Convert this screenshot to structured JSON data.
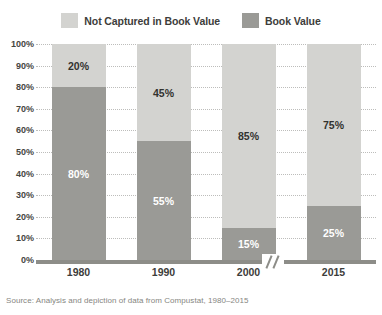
{
  "legend": {
    "items": [
      {
        "label": "Not Captured in Book Value",
        "color": "#d3d3d0",
        "swatch_name": "legend-swatch-not-captured"
      },
      {
        "label": "Book Value",
        "color": "#9a9a96",
        "swatch_name": "legend-swatch-book-value"
      }
    ]
  },
  "source": "Source: Analysis and depiction of data from Compustat, 1980–2015",
  "axis": {
    "y_ticks": [
      "100%",
      "90%",
      "80%",
      "70%",
      "60%",
      "50%",
      "40%",
      "30%",
      "20%",
      "10%",
      "0%"
    ],
    "x_ticks": [
      "1980",
      "1990",
      "2000",
      "2015"
    ],
    "break_between": [
      "2000",
      "2015"
    ]
  },
  "bars": [
    {
      "category": "1980",
      "top_label": "20%",
      "bottom_label": "80%",
      "top_value": 20,
      "bottom_value": 80
    },
    {
      "category": "1990",
      "top_label": "45%",
      "bottom_label": "55%",
      "top_value": 45,
      "bottom_value": 55
    },
    {
      "category": "2000",
      "top_label": "85%",
      "bottom_label": "15%",
      "top_value": 85,
      "bottom_value": 15
    },
    {
      "category": "2015",
      "top_label": "75%",
      "bottom_label": "25%",
      "top_value": 75,
      "bottom_value": 25
    }
  ],
  "chart_data": {
    "type": "bar",
    "stacked": true,
    "normalized": true,
    "title": "",
    "subtitle": "",
    "xlabel": "",
    "ylabel": "",
    "ylim": [
      0,
      100
    ],
    "ytick_step": 10,
    "grid": true,
    "grid_style": "dotted-horizontal",
    "legend_position": "top-center",
    "axis_break": "between 2000 and 2015",
    "categories": [
      "1980",
      "1990",
      "2000",
      "2015"
    ],
    "series": [
      {
        "name": "Not Captured in Book Value",
        "color": "#d3d3d0",
        "values": [
          20,
          45,
          85,
          75
        ],
        "data_labels": [
          "20%",
          "45%",
          "85%",
          "75%"
        ]
      },
      {
        "name": "Book Value",
        "color": "#9a9a96",
        "values": [
          80,
          55,
          15,
          25
        ],
        "data_labels": [
          "80%",
          "55%",
          "15%",
          "25%"
        ]
      }
    ],
    "ytick_labels": [
      "0%",
      "10%",
      "20%",
      "30%",
      "40%",
      "50%",
      "60%",
      "70%",
      "80%",
      "90%",
      "100%"
    ],
    "source_note": "Source: Analysis and depiction of data from Compustat, 1980–2015"
  }
}
